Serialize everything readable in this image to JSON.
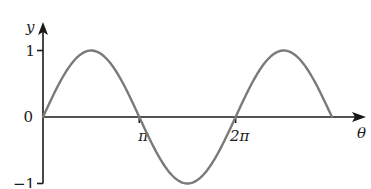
{
  "chart_data": {
    "type": "line",
    "title": "",
    "function": "y = sin(theta)",
    "xlabel": "θ",
    "ylabel": "y",
    "xlim": [
      0,
      9.4248
    ],
    "ylim": [
      -1,
      1
    ],
    "x_ticks": [
      {
        "value": 3.14159,
        "label": "π"
      },
      {
        "value": 6.28319,
        "label": "2π"
      }
    ],
    "y_ticks": [
      {
        "value": 1,
        "label": "1"
      },
      {
        "value": -1,
        "label": "−1"
      }
    ],
    "origin_label": "0",
    "series": [
      {
        "name": "sin θ",
        "color": "#7a7a7a",
        "x": [
          0,
          0.7854,
          1.5708,
          2.3562,
          3.1416,
          3.927,
          4.7124,
          5.4978,
          6.2832,
          7.0686,
          7.854,
          8.6394,
          9.4248
        ],
        "y": [
          0,
          0.707,
          1,
          0.707,
          0,
          -0.707,
          -1,
          -0.707,
          0,
          0.707,
          1,
          0.707,
          0
        ]
      }
    ],
    "grid": false,
    "legend": "none"
  }
}
